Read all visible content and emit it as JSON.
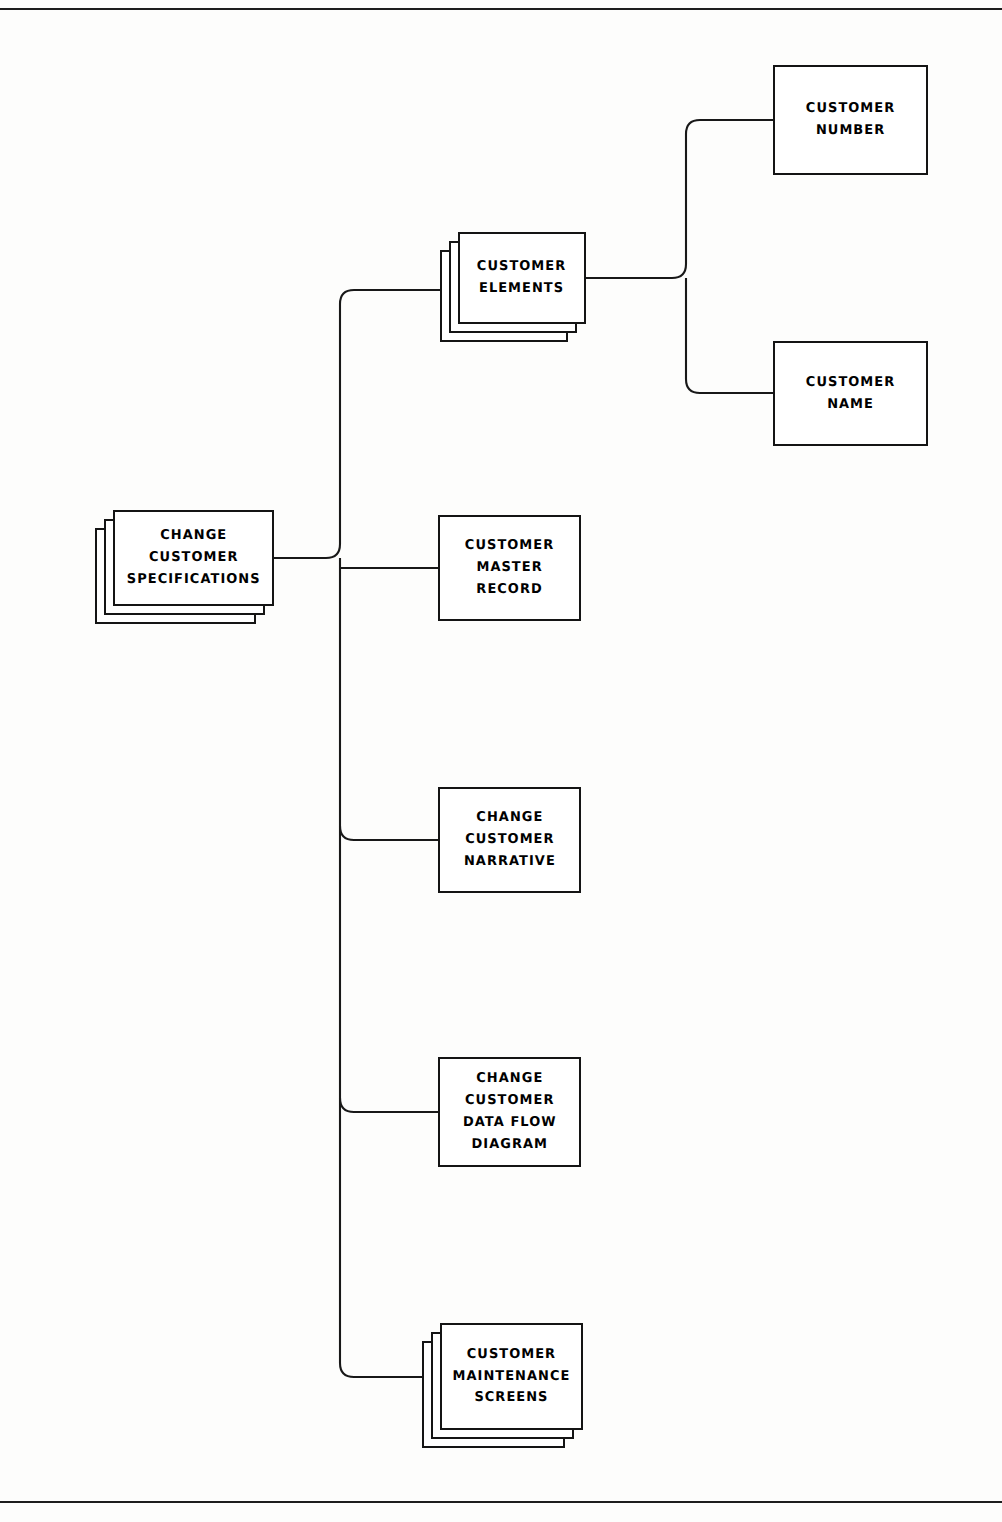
{
  "page": {
    "background_color": "#fdfdfc",
    "line_color": "#181818",
    "width": 1002,
    "height": 1522
  },
  "diagram": {
    "type": "hierarchy-tree",
    "orientation": "left-to-right",
    "root_id": "change-customer-specifications",
    "nodes": [
      {
        "id": "change-customer-specifications",
        "label": "CHANGE\nCUSTOMER\nSPECIFICATIONS",
        "style": "stacked",
        "layers": 3,
        "x": 113,
        "y": 510,
        "w": 161,
        "h": 96
      },
      {
        "id": "customer-elements",
        "label": "CUSTOMER\nELEMENTS",
        "style": "stacked",
        "layers": 3,
        "x": 458,
        "y": 232,
        "w": 128,
        "h": 92
      },
      {
        "id": "customer-number",
        "label": "CUSTOMER\nNUMBER",
        "style": "single",
        "layers": 1,
        "x": 773,
        "y": 65,
        "w": 155,
        "h": 110
      },
      {
        "id": "customer-name",
        "label": "CUSTOMER\nNAME",
        "style": "single",
        "layers": 1,
        "x": 773,
        "y": 341,
        "w": 155,
        "h": 105
      },
      {
        "id": "customer-master-record",
        "label": "CUSTOMER\nMASTER\nRECORD",
        "style": "single",
        "layers": 1,
        "x": 438,
        "y": 515,
        "w": 143,
        "h": 106
      },
      {
        "id": "change-customer-narrative",
        "label": "CHANGE\nCUSTOMER\nNARRATIVE",
        "style": "single",
        "layers": 1,
        "x": 438,
        "y": 787,
        "w": 143,
        "h": 106
      },
      {
        "id": "change-customer-data-flow-diagram",
        "label": "CHANGE\nCUSTOMER\nDATA FLOW\nDIAGRAM",
        "style": "single",
        "layers": 1,
        "x": 438,
        "y": 1057,
        "w": 143,
        "h": 110
      },
      {
        "id": "customer-maintenance-screens",
        "label": "CUSTOMER\nMAINTENANCE\nSCREENS",
        "style": "stacked",
        "layers": 3,
        "x": 440,
        "y": 1323,
        "w": 143,
        "h": 107
      }
    ],
    "edges": [
      {
        "from": "change-customer-specifications",
        "to": "customer-elements"
      },
      {
        "from": "change-customer-specifications",
        "to": "customer-master-record"
      },
      {
        "from": "change-customer-specifications",
        "to": "change-customer-narrative"
      },
      {
        "from": "change-customer-specifications",
        "to": "change-customer-data-flow-diagram"
      },
      {
        "from": "change-customer-specifications",
        "to": "customer-maintenance-screens"
      },
      {
        "from": "customer-elements",
        "to": "customer-number"
      },
      {
        "from": "customer-elements",
        "to": "customer-name"
      }
    ],
    "wires": {
      "trunk_main": "M 274,558 L 330,558",
      "spine_main": "M 340,290 L 340,1377",
      "branch_elements": "M 340,290 L 458,290",
      "branch_master_record": "M 340,568 L 438,568",
      "branch_narrative": "M 340,840 L 438,840",
      "branch_dataflow": "M 340,1112 L 438,1112",
      "branch_screens": "M 340,1377 L 440,1377",
      "trunk_elements": "M 586,278 L 676,278",
      "spine_elements": "M 686,120 L 686,393",
      "branch_number": "M 686,120 L 773,120",
      "branch_name": "M 686,393 L 773,393",
      "corner_radius": 14
    }
  },
  "frame": {
    "top_rule": "horizontal-rule",
    "bottom_rule": "horizontal-rule"
  }
}
